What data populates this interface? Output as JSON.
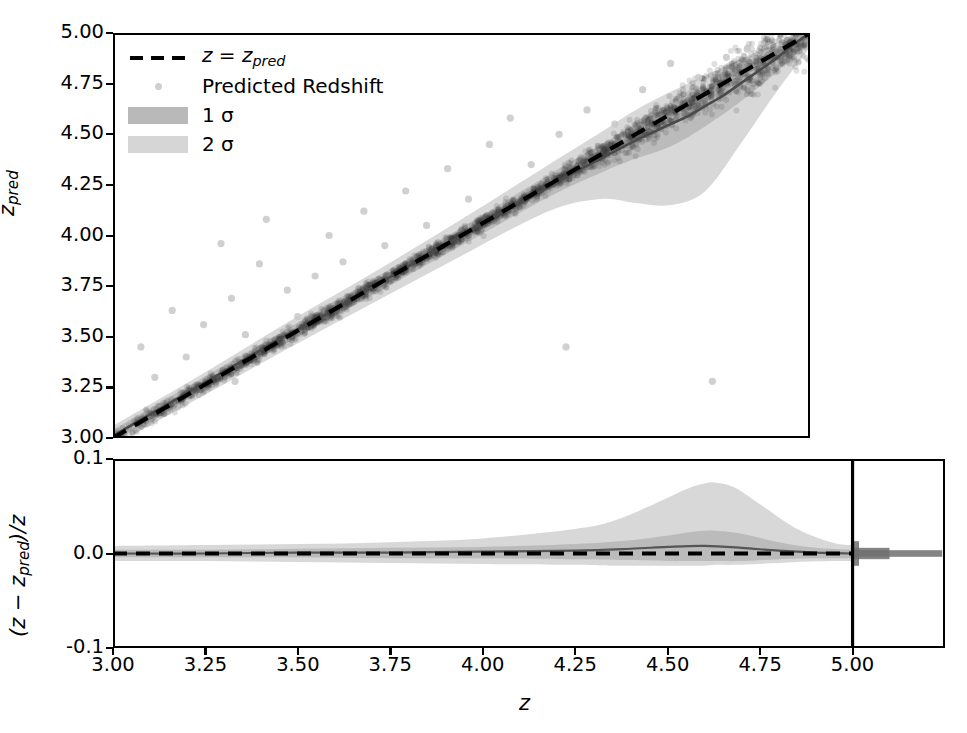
{
  "figure": {
    "background": "#ffffff",
    "axis_color": "#000000"
  },
  "legend": {
    "entries": [
      {
        "key": "dashed-line",
        "label": "z = z_pred",
        "label_html": "identity",
        "color": "#000000"
      },
      {
        "key": "scatter-marker",
        "label": "Predicted Redshift",
        "color": "#cfcfcf"
      },
      {
        "key": "band-1sigma",
        "label": "1 σ",
        "color": "#b9b9b9"
      },
      {
        "key": "band-2sigma",
        "label": "2 σ",
        "color": "#d6d6d6"
      }
    ],
    "identity_label_main": "z = z",
    "identity_label_sub": "pred",
    "sigma1_label": "1 σ",
    "sigma2_label": "2 σ",
    "scatter_label": "Predicted Redshift"
  },
  "upper_panel": {
    "ylabel_main": "z",
    "ylabel_sub": "pred",
    "y_ticks": [
      "3.00",
      "3.25",
      "3.50",
      "3.75",
      "4.00",
      "4.25",
      "4.50",
      "4.75",
      "5.00"
    ],
    "ylim": [
      3.0,
      5.0
    ],
    "xlim": [
      3.0,
      5.0
    ]
  },
  "lower_panel": {
    "ylabel_pre": "(z − z",
    "ylabel_sub": "pred",
    "ylabel_post": ")/z",
    "y_ticks": [
      "-0.1",
      "0.0",
      "0.1"
    ],
    "ylim": [
      -0.1,
      0.1
    ],
    "xlim": [
      3.0,
      5.25
    ],
    "vline_x": 5.0
  },
  "x_axis": {
    "label": "z",
    "ticks": [
      "3.00",
      "3.25",
      "3.50",
      "3.75",
      "4.00",
      "4.25",
      "4.50",
      "4.75",
      "5.00"
    ],
    "tick_values": [
      3.0,
      3.25,
      3.5,
      3.75,
      4.0,
      4.25,
      4.5,
      4.75,
      5.0
    ]
  },
  "chart_data": {
    "type": "scatter",
    "title": "",
    "xlabel": "z",
    "ylabel_upper": "z_pred",
    "ylabel_lower": "(z - z_pred)/z",
    "xlim": [
      3.0,
      5.0
    ],
    "ylim_upper": [
      3.0,
      5.0
    ],
    "ylim_lower": [
      -0.1,
      0.1
    ],
    "grid": false,
    "legend_position": "upper left",
    "identity_line": {
      "x": [
        3.0,
        5.0
      ],
      "y": [
        3.0,
        5.0
      ],
      "style": "dashed",
      "color": "#000000"
    },
    "mean_curve_upper": {
      "x": [
        3.0,
        3.1,
        3.2,
        3.3,
        3.4,
        3.5,
        3.6,
        3.7,
        3.8,
        3.9,
        4.0,
        4.1,
        4.2,
        4.3,
        4.4,
        4.5,
        4.55,
        4.6,
        4.65,
        4.7,
        4.75,
        4.8,
        4.85,
        4.9,
        4.95,
        5.0
      ],
      "y": [
        3.01,
        3.11,
        3.21,
        3.31,
        3.41,
        3.51,
        3.6,
        3.7,
        3.8,
        3.9,
        4.0,
        4.1,
        4.19,
        4.29,
        4.38,
        4.47,
        4.51,
        4.55,
        4.59,
        4.64,
        4.69,
        4.75,
        4.81,
        4.87,
        4.94,
        5.0
      ]
    },
    "sigma1_upper": {
      "x": [
        3.0,
        3.25,
        3.5,
        3.75,
        4.0,
        4.25,
        4.4,
        4.5,
        4.6,
        4.7,
        4.8,
        4.9,
        5.0
      ],
      "low": [
        2.98,
        3.23,
        3.47,
        3.71,
        3.95,
        4.19,
        4.31,
        4.38,
        4.44,
        4.54,
        4.66,
        4.8,
        4.96
      ],
      "high": [
        3.04,
        3.29,
        3.54,
        3.79,
        4.04,
        4.3,
        4.45,
        4.55,
        4.64,
        4.72,
        4.82,
        4.92,
        5.02
      ]
    },
    "sigma2_upper": {
      "x": [
        3.0,
        3.25,
        3.5,
        3.75,
        4.0,
        4.25,
        4.4,
        4.5,
        4.6,
        4.7,
        4.8,
        4.9,
        5.0
      ],
      "low": [
        2.96,
        3.2,
        3.44,
        3.67,
        3.9,
        4.12,
        4.18,
        4.16,
        4.15,
        4.22,
        4.45,
        4.7,
        4.93
      ],
      "high": [
        3.06,
        3.31,
        3.57,
        3.82,
        4.08,
        4.35,
        4.51,
        4.62,
        4.71,
        4.79,
        4.87,
        4.95,
        5.04
      ]
    },
    "residual_mean": {
      "x": [
        3.0,
        3.25,
        3.5,
        3.75,
        4.0,
        4.25,
        4.4,
        4.5,
        4.6,
        4.7,
        4.8,
        4.9,
        5.0
      ],
      "y": [
        0.0,
        0.0,
        0.001,
        0.001,
        0.002,
        0.003,
        0.005,
        0.007,
        0.008,
        0.006,
        0.003,
        0.001,
        0.0
      ]
    },
    "residual_sigma1": {
      "x": [
        3.0,
        3.25,
        3.5,
        3.75,
        4.0,
        4.25,
        4.4,
        4.5,
        4.55,
        4.6,
        4.63,
        4.7,
        4.8,
        4.9,
        5.0
      ],
      "low": [
        -0.004,
        -0.004,
        -0.004,
        -0.005,
        -0.005,
        -0.006,
        -0.007,
        -0.008,
        -0.008,
        -0.008,
        -0.008,
        -0.008,
        -0.006,
        -0.005,
        -0.005
      ],
      "high": [
        0.004,
        0.004,
        0.005,
        0.006,
        0.007,
        0.01,
        0.014,
        0.019,
        0.022,
        0.024,
        0.024,
        0.021,
        0.012,
        0.006,
        0.004
      ]
    },
    "residual_sigma2": {
      "x": [
        3.0,
        3.25,
        3.5,
        3.75,
        4.0,
        4.25,
        4.35,
        4.45,
        4.55,
        4.6,
        4.63,
        4.68,
        4.75,
        4.85,
        4.95,
        5.0
      ],
      "low": [
        -0.008,
        -0.008,
        -0.009,
        -0.01,
        -0.011,
        -0.012,
        -0.013,
        -0.013,
        -0.013,
        -0.013,
        -0.012,
        -0.012,
        -0.011,
        -0.009,
        -0.008,
        -0.008
      ],
      "high": [
        0.008,
        0.009,
        0.01,
        0.012,
        0.016,
        0.026,
        0.034,
        0.05,
        0.068,
        0.074,
        0.075,
        0.07,
        0.052,
        0.026,
        0.011,
        0.009
      ]
    },
    "residual_tail_band": {
      "x_start": 5.0,
      "x_end": 5.25,
      "description": "horizontal gray band right of z=5"
    },
    "scatter_outliers": [
      {
        "x": 3.08,
        "y": 3.45
      },
      {
        "x": 3.17,
        "y": 3.63
      },
      {
        "x": 3.21,
        "y": 3.4
      },
      {
        "x": 3.26,
        "y": 3.56
      },
      {
        "x": 3.31,
        "y": 3.96
      },
      {
        "x": 3.34,
        "y": 3.69
      },
      {
        "x": 3.38,
        "y": 3.51
      },
      {
        "x": 3.42,
        "y": 3.86
      },
      {
        "x": 3.44,
        "y": 4.08
      },
      {
        "x": 3.5,
        "y": 3.73
      },
      {
        "x": 3.53,
        "y": 3.6
      },
      {
        "x": 3.58,
        "y": 3.8
      },
      {
        "x": 3.62,
        "y": 4.0
      },
      {
        "x": 3.66,
        "y": 3.87
      },
      {
        "x": 3.72,
        "y": 4.12
      },
      {
        "x": 3.78,
        "y": 3.95
      },
      {
        "x": 3.84,
        "y": 4.22
      },
      {
        "x": 3.9,
        "y": 4.05
      },
      {
        "x": 3.96,
        "y": 4.33
      },
      {
        "x": 4.02,
        "y": 4.18
      },
      {
        "x": 4.08,
        "y": 4.45
      },
      {
        "x": 4.14,
        "y": 4.58
      },
      {
        "x": 4.2,
        "y": 4.35
      },
      {
        "x": 4.28,
        "y": 4.5
      },
      {
        "x": 4.36,
        "y": 4.62
      },
      {
        "x": 4.44,
        "y": 4.55
      },
      {
        "x": 4.52,
        "y": 4.72
      },
      {
        "x": 4.6,
        "y": 4.85
      },
      {
        "x": 4.68,
        "y": 4.78
      },
      {
        "x": 4.72,
        "y": 3.28
      },
      {
        "x": 4.3,
        "y": 3.45
      },
      {
        "x": 4.76,
        "y": 4.88
      },
      {
        "x": 4.82,
        "y": 4.92
      },
      {
        "x": 3.35,
        "y": 3.28
      },
      {
        "x": 3.12,
        "y": 3.3
      }
    ],
    "scatter_marker": {
      "color": "#c8c8c8",
      "size": 7,
      "alpha": 0.55
    },
    "colors": {
      "identity": "#000000",
      "mean": "#555555",
      "sigma1": "#b9b9b9",
      "sigma2": "#d6d6d6",
      "scatter": "#c8c8c8",
      "tail_band": "#6e6e6e"
    }
  }
}
